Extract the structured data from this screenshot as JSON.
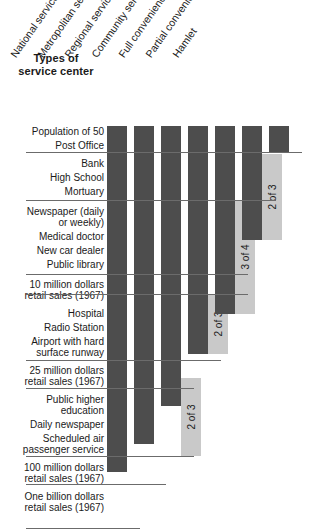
{
  "title": {
    "line1": "Types of",
    "line2": "service center"
  },
  "chart_data": {
    "type": "table",
    "title": "Types of service center",
    "xlabel": "",
    "ylabel": "",
    "grid": false,
    "legend": "none",
    "orientation": "vertical-step-columns",
    "colors": {
      "bar": "#4d4d4d",
      "note_block": "#c9c9c9",
      "rule": "#6b6b6b",
      "background": "#ffffff",
      "text": "#1a1a1a"
    },
    "categories": [
      "National service center",
      "Metropolitan service center",
      "Regional service center",
      "Community service center",
      "Full convenience",
      "Partial convenience",
      "Hamlet"
    ],
    "tiers": [
      {
        "index": 0,
        "functions": [
          "Population of 50",
          "Post Office"
        ],
        "columns_filled": 7
      },
      {
        "index": 1,
        "functions": [
          "Bank",
          "High School",
          "Mortuary"
        ],
        "columns_filled": 6,
        "note": "2 of 3",
        "note_column": "Partial convenience"
      },
      {
        "index": 2,
        "functions": [
          "Newspaper (daily or weekly)",
          "Medical doctor",
          "New car dealer",
          "Public library"
        ],
        "columns_filled": 5,
        "note": "3 of 4",
        "note_column": "Full convenience"
      },
      {
        "index": 3,
        "functions": [
          "10 million dollars retail sales (1967)"
        ],
        "columns_filled": 5
      },
      {
        "index": 4,
        "functions": [
          "Hospital",
          "Radio Station",
          "Airport with hard surface runway"
        ],
        "columns_filled": 4,
        "note": "2 of 3",
        "note_column": "Community service center"
      },
      {
        "index": 5,
        "functions": [
          "25 million dollars retail sales (1967)"
        ],
        "columns_filled": 3
      },
      {
        "index": 6,
        "functions": [
          "Public higher education",
          "Daily newspaper",
          "Scheduled air passenger service"
        ],
        "columns_filled": 3,
        "note": "2 of 3",
        "note_column": "Regional service center"
      },
      {
        "index": 7,
        "functions": [
          "100 million dollars retail sales (1967)"
        ],
        "columns_filled": 2
      },
      {
        "index": 8,
        "functions": [
          "One billion dollars retail sales (1967)"
        ],
        "columns_filled": 1
      }
    ],
    "column_depths_rows": [
      19,
      18,
      16,
      13,
      11,
      7,
      2
    ]
  },
  "columns": [
    {
      "label": "National service center",
      "x": 107,
      "depth": 346
    },
    {
      "label": "Metropolitan service center",
      "x": 134,
      "depth": 318
    },
    {
      "label": "Regional service center",
      "x": 161,
      "depth": 280
    },
    {
      "label": "Community service center",
      "x": 188,
      "depth": 228
    },
    {
      "label": "Full convenience",
      "x": 215,
      "depth": 188
    },
    {
      "label": "Partial convenience",
      "x": 242,
      "depth": 114
    },
    {
      "label": "Hamlet",
      "x": 269,
      "depth": 26
    }
  ],
  "rows": [
    {
      "text": "Population of 50",
      "y": 0
    },
    {
      "text": "Post Office",
      "y": 14
    },
    {
      "text": "Bank",
      "y": 32
    },
    {
      "text": "High School",
      "y": 46
    },
    {
      "text": "Mortuary",
      "y": 60
    },
    {
      "text": "Newspaper (daily",
      "y": 80
    },
    {
      "text": "or weekly)",
      "y": 91
    },
    {
      "text": "Medical doctor",
      "y": 105
    },
    {
      "text": "New car dealer",
      "y": 119
    },
    {
      "text": "Public library",
      "y": 133
    },
    {
      "text": "10 million dollars",
      "y": 153
    },
    {
      "text": "retail sales (1967)",
      "y": 164
    },
    {
      "text": "Hospital",
      "y": 182
    },
    {
      "text": "Radio Station",
      "y": 196
    },
    {
      "text": "Airport with hard",
      "y": 210
    },
    {
      "text": "surface runway",
      "y": 221
    },
    {
      "text": "25 million dollars",
      "y": 239
    },
    {
      "text": "retail sales (1967)",
      "y": 250
    },
    {
      "text": "Public higher",
      "y": 268
    },
    {
      "text": "education",
      "y": 279
    },
    {
      "text": "Daily newspaper",
      "y": 293
    },
    {
      "text": "Scheduled air",
      "y": 307
    },
    {
      "text": "passenger service",
      "y": 318
    },
    {
      "text": "100 million dollars",
      "y": 336
    },
    {
      "text": "retail sales (1967)",
      "y": 347
    },
    {
      "text": "One billion dollars",
      "y": 365
    },
    {
      "text": "retail sales (1967)",
      "y": 376
    }
  ],
  "notes": [
    {
      "text": "2 of 3",
      "x": 242,
      "y": 28,
      "h": 86,
      "col": "Partial convenience"
    },
    {
      "text": "3 of 4",
      "x": 215,
      "y": 74,
      "h": 114,
      "col": "Full convenience"
    },
    {
      "text": "2 of 3",
      "x": 188,
      "y": 168,
      "h": 60,
      "col": "Community service center"
    },
    {
      "text": "2 of 3",
      "x": 161,
      "y": 252,
      "h": 78,
      "col": "Regional service center"
    }
  ],
  "rules": [
    {
      "y": 26,
      "x": 26,
      "w": 276
    },
    {
      "y": 74,
      "x": 26,
      "w": 250
    },
    {
      "y": 148,
      "x": 26,
      "w": 222
    },
    {
      "y": 168,
      "x": 26,
      "w": 222
    },
    {
      "y": 234,
      "x": 26,
      "w": 195
    },
    {
      "y": 262,
      "x": 26,
      "w": 168
    },
    {
      "y": 330,
      "x": 26,
      "w": 168
    },
    {
      "y": 358,
      "x": 26,
      "w": 140
    },
    {
      "y": 402,
      "x": 26,
      "w": 114
    }
  ],
  "header_positions": [
    {
      "x": 111,
      "y": 125
    },
    {
      "x": 138,
      "y": 125
    },
    {
      "x": 165,
      "y": 125
    },
    {
      "x": 192,
      "y": 125
    },
    {
      "x": 219,
      "y": 125
    },
    {
      "x": 246,
      "y": 125
    },
    {
      "x": 273,
      "y": 125
    }
  ]
}
